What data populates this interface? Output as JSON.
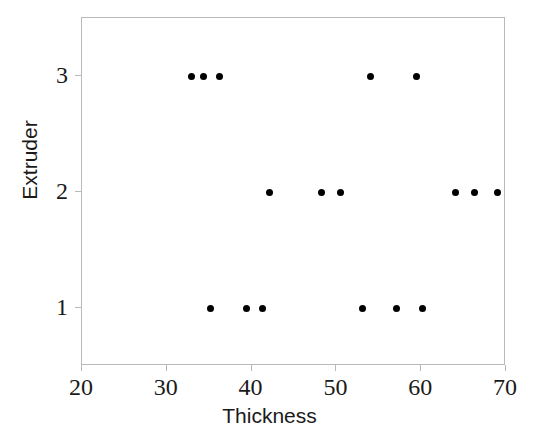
{
  "chart_data": {
    "type": "scatter",
    "title": "",
    "xlabel": "Thickness",
    "ylabel": "Extruder",
    "xlim": [
      20,
      70
    ],
    "ylim": [
      0.5,
      3.5
    ],
    "xticks": [
      20,
      30,
      40,
      50,
      60,
      70
    ],
    "yticks": [
      1,
      2,
      3
    ],
    "xtick_labels": [
      "20",
      "30",
      "40",
      "50",
      "60",
      "70"
    ],
    "ytick_labels": [
      "1",
      "2",
      "3"
    ],
    "grid": false,
    "legend": false,
    "marker": "filled-circle",
    "marker_color": "#000000",
    "marker_size_px": 7,
    "frame_color": "#b9b9bc",
    "background": "#ffffff",
    "points": [
      {
        "x": 32.9,
        "y": 3
      },
      {
        "x": 34.3,
        "y": 3
      },
      {
        "x": 36.2,
        "y": 3
      },
      {
        "x": 54.0,
        "y": 3
      },
      {
        "x": 59.4,
        "y": 3
      },
      {
        "x": 42.1,
        "y": 2
      },
      {
        "x": 48.3,
        "y": 2
      },
      {
        "x": 50.5,
        "y": 2
      },
      {
        "x": 64.0,
        "y": 2
      },
      {
        "x": 66.3,
        "y": 2
      },
      {
        "x": 69.0,
        "y": 2
      },
      {
        "x": 35.2,
        "y": 1
      },
      {
        "x": 39.4,
        "y": 1
      },
      {
        "x": 41.3,
        "y": 1
      },
      {
        "x": 53.1,
        "y": 1
      },
      {
        "x": 57.1,
        "y": 1
      },
      {
        "x": 60.1,
        "y": 1
      }
    ],
    "series": [
      {
        "name": "Extruder 1",
        "x": [
          35.2,
          39.4,
          41.3,
          53.1,
          57.1,
          60.1
        ],
        "y": [
          1,
          1,
          1,
          1,
          1,
          1
        ]
      },
      {
        "name": "Extruder 2",
        "x": [
          42.1,
          48.3,
          50.5,
          64.0,
          66.3,
          69.0
        ],
        "y": [
          2,
          2,
          2,
          2,
          2,
          2
        ]
      },
      {
        "name": "Extruder 3",
        "x": [
          32.9,
          34.3,
          36.2,
          54.0,
          59.4
        ],
        "y": [
          3,
          3,
          3,
          3,
          3
        ]
      }
    ]
  }
}
